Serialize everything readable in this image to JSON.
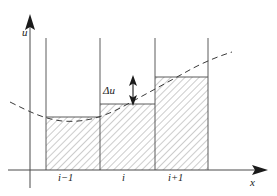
{
  "figure": {
    "type": "diagram",
    "background_color": "#ffffff",
    "line_color": "#4a4a4a",
    "hatch_color": "#8a8a8a",
    "text_color": "#1a1a1a"
  },
  "axes": {
    "y_axis": {
      "label": "u",
      "arrow": true,
      "x_px": 30,
      "top_px": 16,
      "bottom_px": 188
    },
    "x_axis": {
      "label": "x",
      "arrow": true,
      "y_px": 170,
      "left_px": 8,
      "right_px": 268
    }
  },
  "ticks": [
    {
      "label": "i−1",
      "cell_left_px": 46,
      "cell_right_px": 100
    },
    {
      "label": "i",
      "cell_left_px": 100,
      "cell_right_px": 155
    },
    {
      "label": "i+1",
      "cell_left_px": 155,
      "cell_right_px": 208
    }
  ],
  "grid_lines_x_px": [
    46,
    100,
    155,
    208
  ],
  "grid_line_top_px": 38,
  "steps": [
    {
      "name": "step-i-minus-1",
      "x0_px": 46,
      "x1_px": 100,
      "top_px": 117
    },
    {
      "name": "step-i",
      "x0_px": 100,
      "x1_px": 155,
      "top_px": 104
    },
    {
      "name": "step-i-plus-1",
      "x0_px": 155,
      "x1_px": 208,
      "top_px": 77
    }
  ],
  "annotation": {
    "label": "Δu",
    "arrow_x_px": 133,
    "arrow_top_px": 77,
    "arrow_bottom_px": 104,
    "double_headed": true
  },
  "curve": {
    "name": "smooth-solution-curve",
    "style": "dashed",
    "path": "M 10,102 C 30,112 44,119 62,121 C 84,123 104,117 124,106 C 146,94 168,82 186,72 C 200,64 216,57 232,52"
  }
}
